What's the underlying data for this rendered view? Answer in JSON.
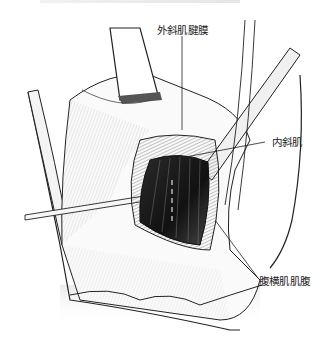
{
  "figure": {
    "labels": [
      {
        "id": "external-oblique-aponeurosis",
        "text": "外斜肌腱膜"
      },
      {
        "id": "internal-oblique",
        "text": "内斜肌"
      },
      {
        "id": "transversus-belly",
        "text": "腹横肌肌腹"
      }
    ]
  }
}
